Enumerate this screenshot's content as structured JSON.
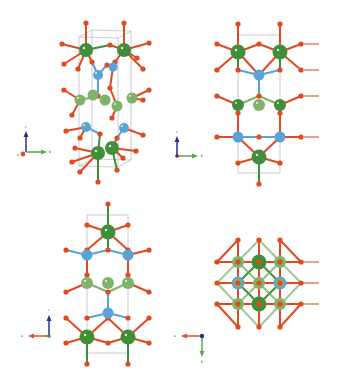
{
  "figure": {
    "colors": {
      "large_cation": "#3f8f3a",
      "small_cation_light": "#7fb26a",
      "medium_cation": "#5aa3d6",
      "anion": "#e2491f",
      "cell_edge": "#a9a9b5",
      "axis_a": "#d9532a",
      "axis_b": "#5aa84a",
      "axis_c": "#2b2f8a"
    },
    "panels": [
      {
        "id": "perspective",
        "axes": {
          "up": "c",
          "right": "b",
          "out": "a"
        }
      },
      {
        "id": "view-along-a",
        "axes": {
          "up": "c",
          "right": "b"
        }
      },
      {
        "id": "view-along-b",
        "axes": {
          "up": "c",
          "left": "a"
        }
      },
      {
        "id": "view-along-c",
        "axes": {
          "left": "a",
          "down": "b"
        }
      }
    ]
  }
}
